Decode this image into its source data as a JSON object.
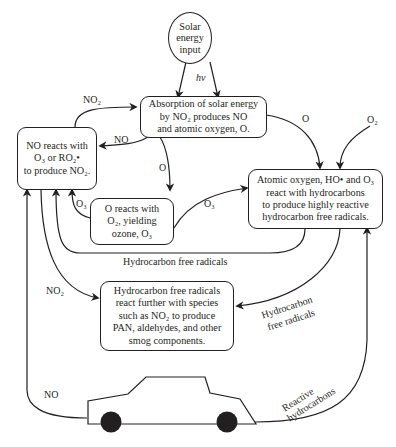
{
  "diagram": {
    "nodes": {
      "solar": {
        "line1": "Solar",
        "line2": "energy",
        "line3": "input"
      },
      "absorption": {
        "line1": "Absorption of solar energy",
        "line2": "by NO₂ produces NO",
        "line3": "and atomic oxygen, O."
      },
      "no_reacts": {
        "line1": "NO reacts with",
        "line2": "O₃ or RO₂•",
        "line3": "to produce NO₂."
      },
      "o_reacts": {
        "line1": "O reacts with",
        "line2": "O₂, yielding",
        "line3": "ozone, O₃"
      },
      "atomic_oxygen": {
        "line1": "Atomic oxygen, HO• and O₃",
        "line2": "react with hydrocarbons",
        "line3": "to produce highly reactive",
        "line4": "hydrocarbon free radicals."
      },
      "hc_free_radicals": {
        "line1": "Hydrocarbon free radicals",
        "line2": "react further with species",
        "line3": "such as NO₂ to produce",
        "line4": "PAN, aldehydes, and other",
        "line5": "smog components."
      }
    },
    "edge_labels": {
      "hv": "hν",
      "no2_top": "NO₂",
      "no": "NO",
      "o_right": "O",
      "o2": "O₂",
      "o_down": "O",
      "o3_left": "O₃",
      "o3_right": "O₃",
      "hc_free_radicals_bottom": "Hydrocarbon free radicals",
      "no2_left": "NO₂",
      "hc_free_radicals_right_1": "Hydrocarbon",
      "hc_free_radicals_right_2": "free radicals",
      "no_car": "NO",
      "reactive_1": "Reactive",
      "reactive_2": "hydrocarbons"
    },
    "colors": {
      "stroke": "#231f20",
      "background": "#ffffff"
    }
  }
}
